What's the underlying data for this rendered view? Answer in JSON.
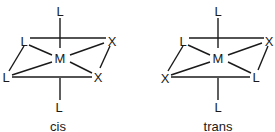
{
  "diagrams": [
    {
      "caption": "cis",
      "center": "M",
      "top": "L",
      "bottom": "L",
      "back_left": "L",
      "back_right": "X",
      "front_left": "L",
      "front_right": "X"
    },
    {
      "caption": "trans",
      "center": "M",
      "top": "L",
      "bottom": "L",
      "back_left": "L",
      "back_right": "X",
      "front_left": "X",
      "front_right": "L"
    }
  ]
}
